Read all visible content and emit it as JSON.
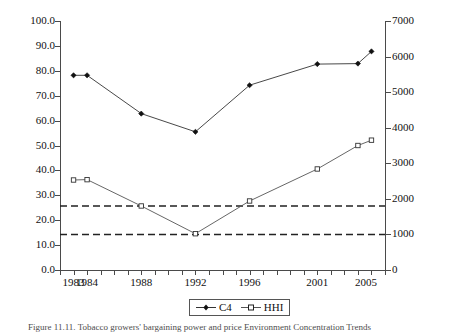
{
  "chart_data": {
    "type": "line",
    "title": "",
    "xlabel": "",
    "ylabel": "",
    "y2label": "",
    "grid": false,
    "legend_position": "bottom-center",
    "x": [
      "1983",
      "1984",
      "1988",
      "1992",
      "1996",
      "2001",
      "2004",
      "2006"
    ],
    "categories": [
      "1983",
      "1984",
      "1988",
      "1992",
      "1996",
      "2001",
      "2004",
      "2006"
    ],
    "xtick_labels": [
      "1983",
      "1984",
      "1988",
      "1992",
      "1996",
      "2001",
      "2005"
    ],
    "ylim": [
      0.0,
      100.0
    ],
    "yticks": [
      "0.0",
      "10.0",
      "20.0",
      "30.0",
      "40.0",
      "50.0",
      "60.0",
      "70.0",
      "80.0",
      "90.0",
      "100.0"
    ],
    "y2lim": [
      0,
      7000
    ],
    "y2ticks": [
      "0",
      "1000",
      "2000",
      "3000",
      "4000",
      "5000",
      "6000",
      "7000"
    ],
    "series": [
      {
        "name": "C4",
        "axis": "left",
        "marker": "filled-diamond",
        "values": [
          78.2,
          78.2,
          62.8,
          55.5,
          74.2,
          82.7,
          82.9,
          87.8
        ]
      },
      {
        "name": "HHI",
        "axis": "right",
        "marker": "open-square",
        "values": [
          2530,
          2540,
          1800,
          1020,
          1940,
          2840,
          3500,
          3650
        ]
      }
    ],
    "reference_lines": [
      {
        "name": "hhi-upper-threshold",
        "axis": "right",
        "value": 1800,
        "style": "dashed"
      },
      {
        "name": "hhi-lower-threshold",
        "axis": "right",
        "value": 1000,
        "style": "dashed"
      }
    ]
  },
  "legend": {
    "items": [
      {
        "label": "C4"
      },
      {
        "label": "HHI"
      }
    ]
  },
  "caption": {
    "text": "Figure 11.11. Tobacco growers' bargaining power and price Environment Concentration Trends"
  },
  "colors": {
    "axis": "#4a4a4a",
    "series_c4": "#333333",
    "series_hhi": "#555555",
    "reference_line": "#222222",
    "text": "#111111"
  }
}
